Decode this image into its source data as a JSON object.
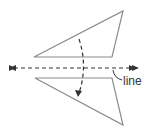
{
  "diagram": {
    "type": "reflection",
    "labels": {
      "line": "line"
    },
    "colors": {
      "stroke": "#8a8a8a",
      "dash": "#333333",
      "text": "#333333",
      "background": "#ffffff"
    },
    "shapes": [
      {
        "name": "original-triangle",
        "points": [
          [
            34,
            57
          ],
          [
            123,
            11
          ],
          [
            112,
            57
          ]
        ]
      },
      {
        "name": "reflected-triangle",
        "points": [
          [
            35,
            78
          ],
          [
            112,
            78
          ],
          [
            123,
            125
          ]
        ]
      }
    ],
    "line_of_reflection": {
      "x1": 10,
      "y1": 68,
      "x2": 138,
      "y2": 68,
      "style": "dashed",
      "arrows": "both"
    },
    "flip_arrow": {
      "style": "dashed",
      "direction": "down"
    }
  }
}
